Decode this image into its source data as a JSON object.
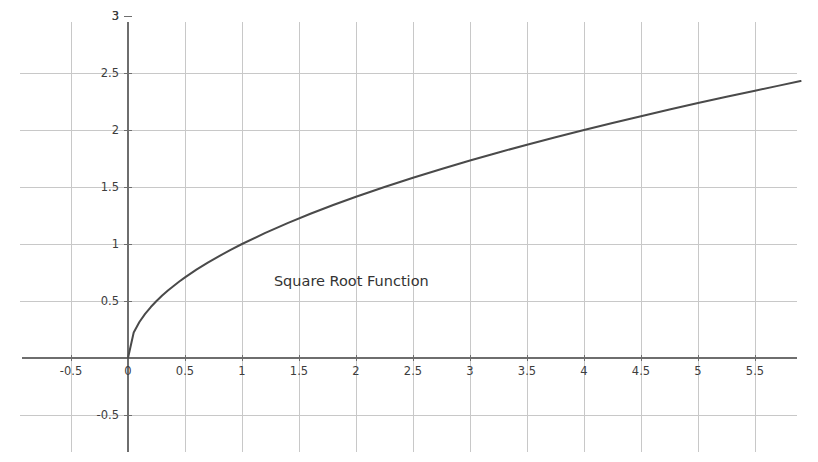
{
  "chart_data": {
    "type": "line",
    "title": "",
    "subtitle": "",
    "xlabel": "",
    "ylabel": "",
    "xlim": [
      -0.75,
      5.85
    ],
    "ylim": [
      -0.78,
      3.05
    ],
    "grid": true,
    "legend": null,
    "legend_position": "none",
    "annotations": [
      {
        "text": "Square Root Function",
        "x": 1.28,
        "y": 0.63
      }
    ],
    "xticks": [
      -0.5,
      0,
      0.5,
      1,
      1.5,
      2,
      2.5,
      3,
      3.5,
      4,
      4.5,
      5,
      5.5
    ],
    "xtick_labels": [
      "-0.5",
      "0",
      "0.5",
      "1",
      "1.5",
      "2",
      "2.5",
      "3",
      "3.5",
      "4",
      "4.5",
      "5",
      "5.5"
    ],
    "yticks": [
      -0.5,
      0.5,
      1,
      1.5,
      2,
      2.5,
      3
    ],
    "ytick_labels": [
      "-0.5",
      "0.5",
      "1",
      "1.5",
      "2",
      "2.5",
      "3"
    ],
    "series": [
      {
        "name": "Square Root Function",
        "formula": "y = sqrt(x)",
        "color": "#4a4a4a",
        "line_width": 2,
        "x": [
          0,
          0.05,
          0.1,
          0.15,
          0.2,
          0.25,
          0.3,
          0.35,
          0.4,
          0.45,
          0.5,
          0.6,
          0.7,
          0.8,
          0.9,
          1,
          1.2,
          1.4,
          1.6,
          1.8,
          2,
          2.25,
          2.5,
          2.75,
          3,
          3.25,
          3.5,
          3.75,
          4,
          4.25,
          4.5,
          4.75,
          5,
          5.25,
          5.5,
          5.7,
          5.9
        ],
        "values": [
          0,
          0.224,
          0.316,
          0.387,
          0.447,
          0.5,
          0.548,
          0.592,
          0.632,
          0.671,
          0.707,
          0.775,
          0.837,
          0.894,
          0.949,
          1,
          1.095,
          1.183,
          1.265,
          1.342,
          1.414,
          1.5,
          1.581,
          1.658,
          1.732,
          1.803,
          1.871,
          1.936,
          2,
          2.062,
          2.121,
          2.179,
          2.236,
          2.291,
          2.345,
          2.387,
          2.429
        ]
      }
    ],
    "colors": {
      "curve": "#4a4a4a",
      "grid": "#c8c8c8",
      "axis": "#6e6e6e",
      "tick_label": "#3d3d3d",
      "background": "#ffffff"
    }
  }
}
